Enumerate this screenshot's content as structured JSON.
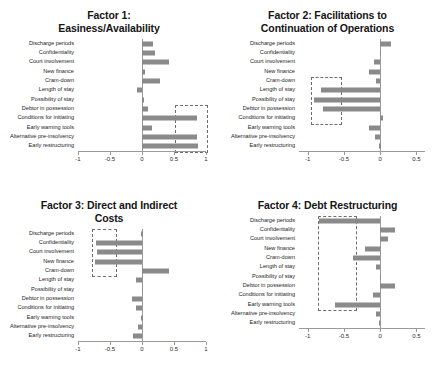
{
  "figure": {
    "categories": [
      "Discharge periods",
      "Confidentiality",
      "Court involvement",
      "New finance",
      "Cram-down",
      "Length of stay",
      "Possibility of stay",
      "Debtor in possession",
      "Conditions for initiating",
      "Early warning tools",
      "Alternative pre-insolvency",
      "Early restructuring"
    ]
  },
  "chart_data": [
    {
      "type": "bar",
      "orientation": "horizontal",
      "title": "Factor 1:\nEasiness/Availability",
      "xlabel": "",
      "ylabel": "",
      "xlim": [
        -1,
        1
      ],
      "xticks": [
        -1,
        -0.5,
        0,
        0.5,
        1
      ],
      "xticklabels": [
        "-1",
        "-0.5",
        "0",
        "0.5",
        "1"
      ],
      "grid": false,
      "legend": "none",
      "categories": [
        "Discharge periods",
        "Confidentiality",
        "Court involvement",
        "New finance",
        "Cram-down",
        "Length of stay",
        "Possibility of stay",
        "Debtor in possession",
        "Conditions for initiating",
        "Early warning tools",
        "Alternative pre-insolvency",
        "Early restructuring"
      ],
      "values": [
        0.17,
        0.2,
        0.42,
        0.05,
        0.28,
        -0.08,
        0.03,
        0.09,
        0.86,
        0.15,
        0.86,
        0.87
      ],
      "annotation": {
        "type": "dashed-box",
        "x_range": [
          0.52,
          1.0
        ],
        "category_range": [
          "Debtor in possession",
          "Early restructuring"
        ]
      }
    },
    {
      "type": "bar",
      "orientation": "horizontal",
      "title": "Factor 2: Facilitations to\nContinuation of Operations",
      "xlabel": "",
      "ylabel": "",
      "xlim": [
        -1.12,
        0.62
      ],
      "xticks": [
        -1,
        -0.5,
        0,
        0.5
      ],
      "xticklabels": [
        "-1",
        "-0.5",
        "0",
        "0.5"
      ],
      "grid": false,
      "legend": "none",
      "categories": [
        "Discharge periods",
        "Confidentiality",
        "Court involvement",
        "New finance",
        "Cram-down",
        "Length of stay",
        "Possibility of stay",
        "Debtor in possession",
        "Conditions for initiating",
        "Early warning tools",
        "Alternative pre-insolvency",
        "Early restructuring"
      ],
      "values": [
        0.15,
        0.01,
        -0.08,
        -0.16,
        -0.06,
        -0.81,
        -0.91,
        -0.79,
        0.04,
        -0.16,
        -0.07,
        -0.01
      ],
      "annotation": {
        "type": "dashed-box",
        "x_range": [
          -0.95,
          -0.55
        ],
        "category_range": [
          "Cram-down",
          "Conditions for initiating"
        ]
      }
    },
    {
      "type": "bar",
      "orientation": "horizontal",
      "title": "Factor 3: Direct and Indirect\nCosts",
      "xlabel": "",
      "ylabel": "",
      "xlim": [
        -1,
        1
      ],
      "xticks": [
        -1,
        -0.5,
        0,
        0.5,
        1
      ],
      "xticklabels": [
        "-1",
        "-0.5",
        "0",
        "0.5",
        "1"
      ],
      "grid": false,
      "legend": "none",
      "categories": [
        "Discharge periods",
        "Confidentiality",
        "Court involvement",
        "New finance",
        "Cram-down",
        "Length of stay",
        "Possibility of stay",
        "Debtor in possession",
        "Conditions for initiating",
        "Early warning tools",
        "Alternative pre-insolvency",
        "Early restructuring"
      ],
      "values": [
        -0.01,
        -0.72,
        -0.71,
        -0.73,
        0.42,
        -0.1,
        0.02,
        -0.16,
        -0.09,
        -0.01,
        -0.06,
        -0.14
      ],
      "annotation": {
        "type": "dashed-box",
        "x_range": [
          -0.78,
          -0.42
        ],
        "category_range": [
          "Discharge periods",
          "Cram-down"
        ]
      }
    },
    {
      "type": "bar",
      "orientation": "horizontal",
      "title": "Factor 4: Debt Restructuring",
      "xlabel": "",
      "ylabel": "",
      "xlim": [
        -1.12,
        0.62
      ],
      "xticks": [
        -1,
        -0.5,
        0,
        0.5
      ],
      "xticklabels": [
        "-1",
        "-0.5",
        "0",
        "0.5"
      ],
      "grid": false,
      "legend": "none",
      "categories": [
        "Discharge periods",
        "Confidentiality",
        "Court involvement",
        "New finance",
        "Cram-down",
        "Length of stay",
        "Possibility of stay",
        "Debtor in possession",
        "Conditions for initiating",
        "Early warning tools",
        "Alternative pre-insolvency",
        "Early restructuring"
      ],
      "values": [
        -0.84,
        0.2,
        0.11,
        -0.21,
        -0.37,
        -0.05,
        0.01,
        0.2,
        -0.1,
        -0.62,
        -0.06,
        -0.02
      ],
      "annotation": {
        "type": "dashed-box",
        "x_range": [
          -0.86,
          -0.35
        ],
        "category_range": [
          "Discharge periods",
          "Early warning tools"
        ]
      }
    }
  ]
}
